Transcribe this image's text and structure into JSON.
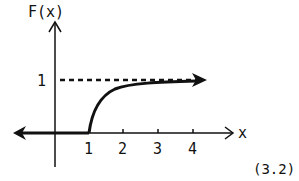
{
  "diagram": {
    "y_axis_label": "F(x)",
    "x_axis_label": "x",
    "y_tick_label": "1",
    "x_tick_labels": [
      "1",
      "2",
      "3",
      "4"
    ],
    "equation_number": "(3.2)",
    "asymptote_value": "1",
    "colors": {
      "ink": "#111111",
      "background": "#ffffff"
    }
  }
}
